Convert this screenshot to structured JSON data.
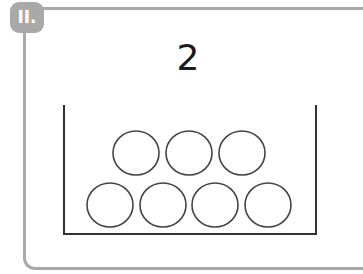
{
  "badge": {
    "label": "II."
  },
  "problem": {
    "number": "2"
  },
  "container": {
    "circle_count": 7,
    "rows": [
      {
        "count": 3
      },
      {
        "count": 4
      }
    ]
  },
  "colors": {
    "frame": "#a9a9a9",
    "stroke": "#333333"
  }
}
